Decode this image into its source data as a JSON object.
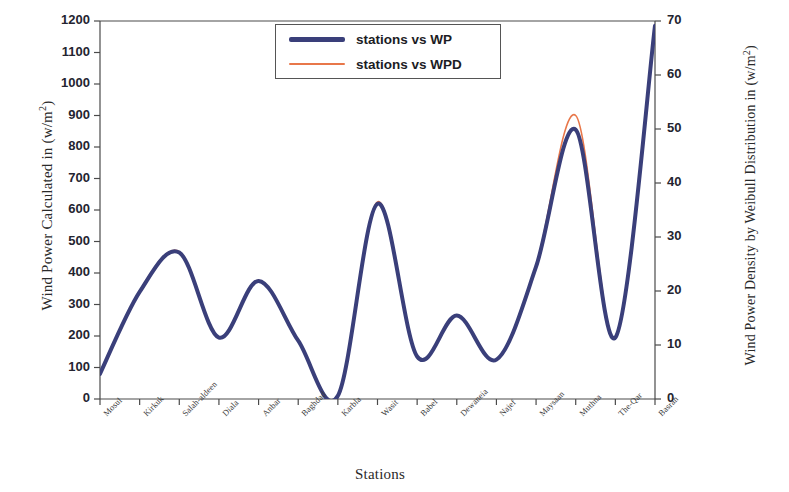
{
  "chart_data": {
    "type": "line",
    "title": "",
    "xlabel": "Stations",
    "ylabel": "Wind Power Calculated in (w/m2)",
    "ylabel_right": "Wind Power Density by Weibull Distribution in (w/m2)",
    "categories": [
      "Mosul",
      "Kirkuk",
      "Salah-aldeen",
      "Diala",
      "Anbar",
      "Baghdad",
      "Karbla",
      "Wasit",
      "Babel",
      "Dewaneia",
      "Najef",
      "Maysaan",
      "Muthna",
      "The-Qar",
      "Basrah"
    ],
    "series": [
      {
        "name": "stations  vs WP",
        "color": "#3a3f7a",
        "axis": "left",
        "width": 4,
        "values": [
          80,
          340,
          465,
          195,
          375,
          185,
          10,
          620,
          135,
          265,
          125,
          420,
          855,
          195,
          1185
        ]
      },
      {
        "name": "stations  vs WPD",
        "color": "#e8774a",
        "axis": "right",
        "width": 1.6,
        "values": [
          4.7,
          20.0,
          27.3,
          11.4,
          22.0,
          10.9,
          0.6,
          36.5,
          7.9,
          15.5,
          7.3,
          24.7,
          52.5,
          11.4,
          69.3
        ]
      }
    ],
    "yticks_left": [
      0,
      100,
      200,
      300,
      400,
      500,
      600,
      700,
      800,
      900,
      1000,
      1100,
      1200
    ],
    "ylim_left": [
      0,
      1200
    ],
    "yticks_right": [
      0,
      10,
      20,
      30,
      40,
      50,
      60,
      70
    ],
    "ylim_right": [
      0,
      70
    ],
    "grid": false,
    "legend_position": "top-center",
    "interpolation": "spline"
  },
  "legend": {
    "items": [
      {
        "label": "stations  vs WP",
        "color": "#3a3f7a",
        "thickness": "5px"
      },
      {
        "label": "stations  vs WPD",
        "color": "#e8774a",
        "thickness": "2px"
      }
    ]
  },
  "axes": {
    "left_title_main": "Wind Power Calculated in (w/m",
    "left_title_sup": "2",
    "left_title_end": ")",
    "right_title_main": "Wind Power Density by Weibull Distribution in (w/m",
    "right_title_sup": "2",
    "right_title_end": ")",
    "x_title": "Stations"
  }
}
